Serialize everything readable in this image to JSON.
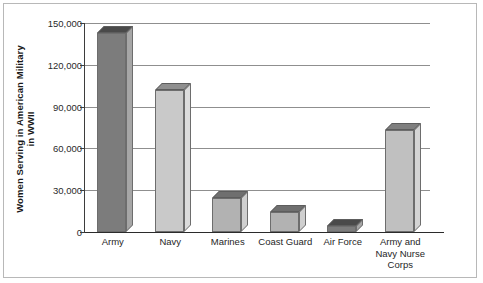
{
  "chart_data": {
    "type": "bar",
    "title": "",
    "xlabel": "",
    "ylabel": "Women Serving in American Military in WWII",
    "ylabel_lines": [
      "Women Serving in American Military",
      "in WWII"
    ],
    "categories": [
      "Army",
      "Navy",
      "Marines",
      "Coast Guard",
      "Air Force",
      "Army and Navy Nurse Corps"
    ],
    "category_lines": [
      [
        "Army"
      ],
      [
        "Navy"
      ],
      [
        "Marines"
      ],
      [
        "Coast Guard"
      ],
      [
        "Air Force"
      ],
      [
        "Army and",
        "Navy Nurse",
        "Corps"
      ]
    ],
    "values": [
      143000,
      102000,
      24500,
      14500,
      4000,
      73500
    ],
    "ylim": [
      0,
      150000
    ],
    "ytick_values": [
      0,
      30000,
      60000,
      90000,
      120000,
      150000
    ],
    "ytick_labels": [
      "0",
      "30,000",
      "60,000",
      "90,000",
      "120,000",
      "150,000"
    ],
    "grid": true,
    "grid_axis": "y",
    "legend": false,
    "bar_colors": [
      "#7c7c7c",
      "#c9c9c9",
      "#b2b2b2",
      "#b2b2b2",
      "#7c7c7c",
      "#c0c0c0"
    ],
    "bar_top_colors": [
      "#4a4a4a",
      "#8f8f8f",
      "#6f6f6f",
      "#6f6f6f",
      "#4a4a4a",
      "#7f7f7f"
    ],
    "bar_side_colors": [
      "#a6a6a6",
      "#dcdcdc",
      "#cfcfcf",
      "#cfcfcf",
      "#a6a6a6",
      "#d4d4d4"
    ],
    "style": "3d-blocks",
    "frame_color": "#b8b8b8",
    "grid_color": "#8f8f8f",
    "axis_color": "#2b2b2b",
    "text_color": "#262626"
  }
}
